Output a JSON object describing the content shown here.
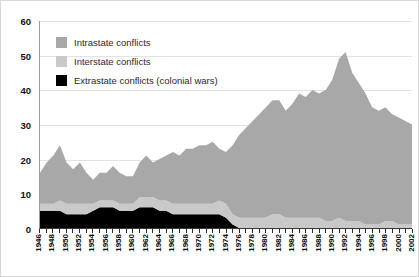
{
  "chart": {
    "type": "area",
    "y_axis": {
      "ticks": [
        "0",
        "10",
        "20",
        "30",
        "40",
        "50",
        "60"
      ],
      "min": 0,
      "max": 60
    },
    "legend": [
      {
        "label": "Intrastate conflicts",
        "color": "#a8a8a8",
        "icon": "legend-swatch-icon"
      },
      {
        "label": "Interstate conflicts",
        "color": "#c9c9c9",
        "icon": "legend-swatch-icon"
      },
      {
        "label": "Extrastate conflicts (colonial wars)",
        "color": "#000000",
        "icon": "legend-swatch-icon"
      }
    ],
    "x_labels": [
      "1946",
      "1948",
      "1950",
      "1952",
      "1954",
      "1956",
      "1958",
      "1960",
      "1962",
      "1964",
      "1966",
      "1968",
      "1970",
      "1972",
      "1974",
      "1976",
      "1978",
      "1980",
      "1982",
      "1984",
      "1986",
      "1988",
      "1990",
      "1992",
      "1994",
      "1996",
      "1998",
      "2000",
      "2002"
    ]
  },
  "chart_data": {
    "type": "area",
    "title": "",
    "subtitle": "",
    "xlabel": "",
    "ylabel": "",
    "stacked": true,
    "grid": true,
    "legend_position": "upper-left",
    "xlim": [
      1946,
      2002
    ],
    "ylim": [
      0,
      60
    ],
    "yticks": [
      0,
      10,
      20,
      30,
      40,
      50,
      60
    ],
    "xticks": [
      1946,
      1948,
      1950,
      1952,
      1954,
      1956,
      1958,
      1960,
      1962,
      1964,
      1966,
      1968,
      1970,
      1972,
      1974,
      1976,
      1978,
      1980,
      1982,
      1984,
      1986,
      1988,
      1990,
      1992,
      1994,
      1996,
      1998,
      2000,
      2002
    ],
    "x": [
      1946,
      1947,
      1948,
      1949,
      1950,
      1951,
      1952,
      1953,
      1954,
      1955,
      1956,
      1957,
      1958,
      1959,
      1960,
      1961,
      1962,
      1963,
      1964,
      1965,
      1966,
      1967,
      1968,
      1969,
      1970,
      1971,
      1972,
      1973,
      1974,
      1975,
      1976,
      1977,
      1978,
      1979,
      1980,
      1981,
      1982,
      1983,
      1984,
      1985,
      1986,
      1987,
      1988,
      1989,
      1990,
      1991,
      1992,
      1993,
      1994,
      1995,
      1996,
      1997,
      1998,
      1999,
      2000,
      2001,
      2002
    ],
    "series": [
      {
        "name": "Extrastate conflicts (colonial wars)",
        "color": "#000000",
        "stack_order": 1,
        "values": [
          5,
          5,
          5,
          5,
          4,
          4,
          4,
          4,
          5,
          6,
          6,
          6,
          5,
          5,
          5,
          6,
          6,
          6,
          5,
          5,
          4,
          4,
          4,
          4,
          4,
          4,
          4,
          4,
          3,
          1,
          0,
          0,
          0,
          0,
          0,
          0,
          0,
          0,
          0,
          0,
          0,
          0,
          0,
          0,
          0,
          0,
          0,
          0,
          0,
          0,
          0,
          0,
          0,
          0,
          0,
          0,
          0
        ]
      },
      {
        "name": "Interstate conflicts",
        "color": "#c9c9c9",
        "stack_order": 2,
        "values": [
          2,
          2,
          2,
          3,
          3,
          3,
          3,
          3,
          2,
          2,
          2,
          2,
          2,
          2,
          2,
          3,
          3,
          3,
          3,
          3,
          3,
          3,
          3,
          3,
          3,
          3,
          3,
          4,
          4,
          3,
          3,
          3,
          3,
          3,
          3,
          4,
          4,
          3,
          3,
          3,
          3,
          3,
          3,
          2,
          2,
          3,
          2,
          2,
          2,
          1,
          1,
          1,
          2,
          2,
          1,
          1,
          1
        ]
      },
      {
        "name": "Intrastate conflicts",
        "color": "#a8a8a8",
        "stack_order": 3,
        "values": [
          9,
          12,
          14,
          16,
          12,
          10,
          12,
          9,
          7,
          8,
          8,
          10,
          9,
          8,
          8,
          10,
          12,
          10,
          12,
          13,
          15,
          14,
          16,
          16,
          17,
          17,
          18,
          15,
          15,
          20,
          24,
          26,
          28,
          30,
          32,
          33,
          33,
          31,
          33,
          36,
          35,
          37,
          36,
          38,
          41,
          46,
          49,
          43,
          40,
          38,
          34,
          33,
          33,
          31,
          31,
          30,
          29
        ]
      }
    ],
    "totals": [
      16,
      19,
      21,
      24,
      19,
      17,
      19,
      16,
      14,
      16,
      16,
      18,
      16,
      15,
      15,
      19,
      21,
      19,
      20,
      21,
      22,
      21,
      23,
      23,
      24,
      24,
      25,
      23,
      22,
      24,
      27,
      29,
      31,
      33,
      35,
      37,
      37,
      34,
      36,
      39,
      38,
      40,
      39,
      40,
      43,
      49,
      51,
      45,
      42,
      39,
      35,
      34,
      35,
      33,
      32,
      31,
      30
    ]
  }
}
